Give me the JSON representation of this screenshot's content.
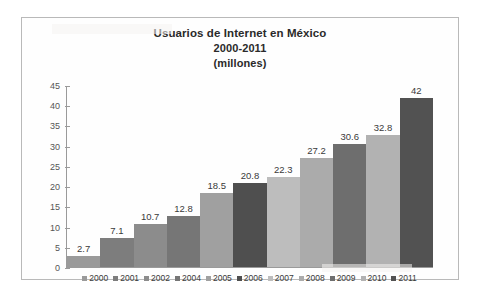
{
  "chart_data": {
    "type": "bar",
    "title": "Usuarios de Internet en México",
    "title_lines": [
      "Usuarios de Internet en México",
      "2000-2011",
      "(millones)"
    ],
    "subtitle": "2000-2011",
    "units": "(millones)",
    "xlabel": "",
    "ylabel": "",
    "ylim": [
      0,
      45
    ],
    "ytick_step": 5,
    "yticks": [
      "45",
      "40",
      "35",
      "30",
      "25",
      "20",
      "15",
      "10",
      "5",
      "0"
    ],
    "grid": false,
    "legend_position": "bottom",
    "categories": [
      "2000",
      "2001",
      "2002",
      "2004",
      "2005",
      "2006",
      "2007",
      "2008",
      "2009",
      "2010",
      "2011"
    ],
    "values": [
      2.7,
      7.1,
      10.7,
      12.8,
      18.5,
      20.8,
      22.3,
      27.2,
      30.6,
      32.8,
      42
    ],
    "value_labels": [
      "2.7",
      "7.1",
      "10.7",
      "12.8",
      "18.5",
      "20.8",
      "22.3",
      "27.2",
      "30.6",
      "32.8",
      "42"
    ],
    "bar_colors": [
      "#9a9a9a",
      "#7d7d7d",
      "#8c8c8c",
      "#767676",
      "#a0a0a0",
      "#4f4f4f",
      "#bdbdbd",
      "#ababab",
      "#6e6e6e",
      "#b2b2b2",
      "#525252"
    ],
    "series": [
      {
        "name": "Usuarios de Internet (millones)",
        "values": [
          2.7,
          7.1,
          10.7,
          12.8,
          18.5,
          20.8,
          22.3,
          27.2,
          30.6,
          32.8,
          42
        ]
      }
    ]
  },
  "colors": {
    "frame_border": "#b9b9b9",
    "axis_line": "#9a9a9a",
    "title_text": "#2a2a2a",
    "tick_text": "#555555",
    "label_text": "#3a3a3a",
    "background": "#ffffff"
  }
}
